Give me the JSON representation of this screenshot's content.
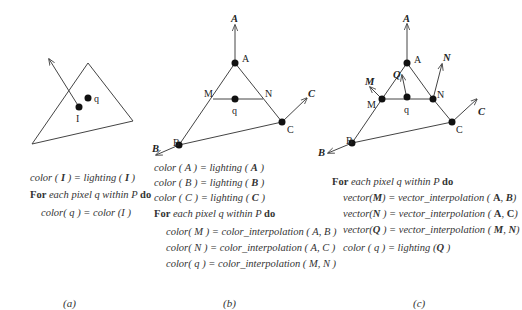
{
  "panels": [
    {
      "caption": "(a)",
      "labels": {
        "q": "q",
        "I": "I"
      },
      "code": {
        "line1": {
          "lhs": "color ( ",
          "arg": "I",
          "mid": " ) = lighting ( ",
          "arg2": "I",
          "end": " )"
        },
        "for_kw": "For",
        "for_text": " each pixel q within P ",
        "do_kw": "do",
        "body": [
          "color( q ) = color (I  )"
        ]
      }
    },
    {
      "caption": "(b)",
      "labels": {
        "A": "A",
        "B": "B",
        "C": "C",
        "M": "M",
        "N": "N",
        "q": "q",
        "vecA": "A",
        "vecB": "B",
        "vecC": "C"
      },
      "code": {
        "init": [
          {
            "pre": "color ( A ) = lighting ( ",
            "arg": "A",
            "end": " )"
          },
          {
            "pre": "color ( B ) = lighting ( ",
            "arg": "B",
            "end": " )"
          },
          {
            "pre": "color ( C ) = lighting ( ",
            "arg": "C",
            "end": " )"
          }
        ],
        "for_kw": "For",
        "for_text": " each pixel q within P ",
        "do_kw": "do",
        "body": [
          "color( M ) =  color_interpolation ( A, B )",
          "color( N ) =  color_interpolation ( A, C )",
          "color( q ) =  color_interpolation ( M, N )"
        ]
      }
    },
    {
      "caption": "(c)",
      "labels": {
        "A": "A",
        "B": "B",
        "C": "C",
        "M": "M",
        "N": "N",
        "q": "q",
        "vecA": "A",
        "vecB": "B",
        "vecC": "C",
        "vecM": "M",
        "vecN": "N",
        "vecQ": "Q"
      },
      "code": {
        "for_kw": "For",
        "for_text": " each pixel q within P ",
        "do_kw": "do",
        "body": [
          {
            "pre": "vector(",
            "v": "M",
            "mid": ") = vector_interpolation ( ",
            "a": "A",
            "sep": ", ",
            "b": "B",
            "end": ")"
          },
          {
            "pre": "vector(",
            "v": "N",
            "mid": " ) = vector_interpolation ( ",
            "a": "A",
            "sep": ", ",
            "b": "C",
            "end": ")"
          },
          {
            "pre": "vector(",
            "v": "Q",
            "mid": " ) = vector_interpolation ( ",
            "a": "M",
            "sep": ", ",
            "b": "N",
            "end": ")"
          }
        ],
        "final": {
          "pre": "color ( q ) = lighting (",
          "arg": "Q",
          "end": " )"
        }
      }
    }
  ]
}
